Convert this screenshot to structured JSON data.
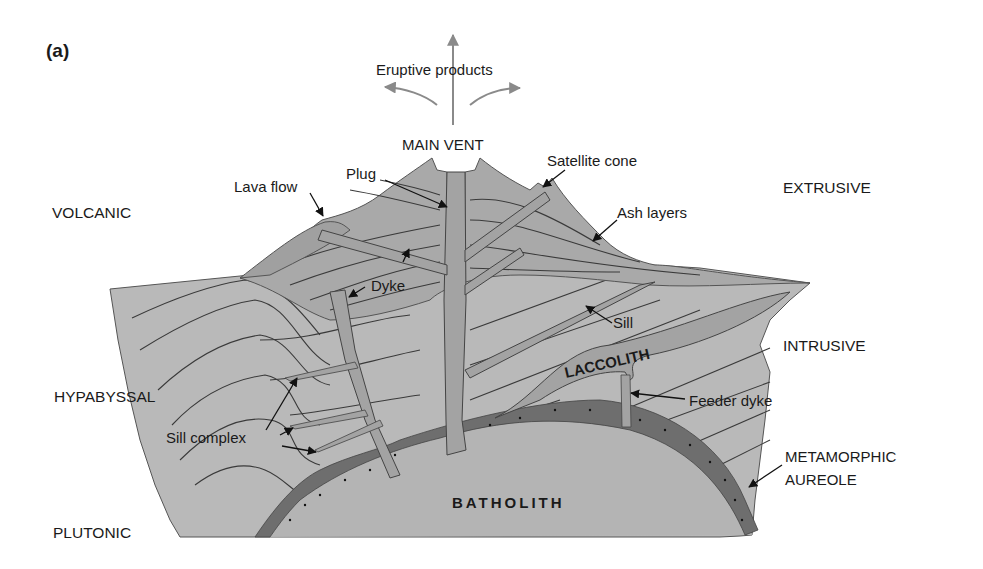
{
  "panel_label": "(a)",
  "eruption": {
    "label": "Eruptive products",
    "arrow_color": "#8a8a8a"
  },
  "labels": {
    "main_vent": "MAIN VENT",
    "satellite_cone": "Satellite cone",
    "plug": "Plug",
    "lava_flow": "Lava flow",
    "ash_layers": "Ash layers",
    "dyke": "Dyke",
    "sill": "Sill",
    "laccolith": "LACCOLITH",
    "feeder_dyke": "Feeder dyke",
    "sill_complex": "Sill complex",
    "batholith": "BATHOLITH",
    "metamorphic_1": "METAMORPHIC",
    "metamorphic_2": "AUREOLE"
  },
  "zones": {
    "volcanic": "VOLCANIC",
    "extrusive": "EXTRUSIVE",
    "intrusive": "INTRUSIVE",
    "hypabyssal": "HYPABYSSAL",
    "plutonic": "PLUTONIC"
  },
  "colors": {
    "country_rock": "#b9b9b9",
    "volcano_cone": "#a9a9a9",
    "intrusion": "#a3a3a3",
    "batholith": "#b4b4b4",
    "aureole": "#6e6e6e",
    "outline": "#3a3a3a",
    "text": "#1a1a1a"
  }
}
